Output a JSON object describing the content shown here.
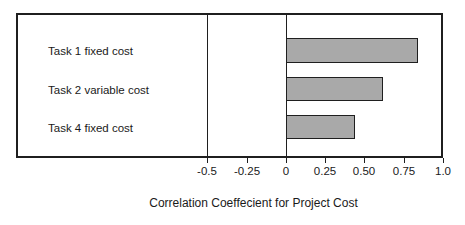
{
  "chart_data": {
    "type": "bar",
    "orientation": "horizontal",
    "title": "",
    "xlabel": "Correlation Coeffecient for Project Cost",
    "ylabel": "",
    "xlim": [
      -0.625,
      1.0
    ],
    "xticks": [
      -0.5,
      -0.25,
      0,
      0.25,
      0.5,
      0.75,
      1.0
    ],
    "xtick_labels": [
      "-0.5",
      "-0.25",
      "0",
      "0.25",
      "0.50",
      "0.75",
      "1.0"
    ],
    "grid": false,
    "legend": null,
    "reference_lines": [
      -0.5,
      0
    ],
    "bar_fill_color": "#a9a9a9",
    "bar_edge_color": "#1f1f1f",
    "categories": [
      "Task 1 fixed cost",
      "Task 2 variable cost",
      "Task 4 fixed cost"
    ],
    "values": [
      0.84,
      0.62,
      0.44
    ],
    "bars": [
      {
        "label": "Task 1 fixed cost",
        "value": 0.84
      },
      {
        "label": "Task 2 variable cost",
        "value": 0.62
      },
      {
        "label": "Task 4 fixed cost",
        "value": 0.44
      }
    ]
  },
  "axis": {
    "title": "Correlation Coeffecient for Project Cost"
  },
  "ticks": {
    "t0": "-0.5",
    "t1": "-0.25",
    "t2": "0",
    "t3": "0.25",
    "t4": "0.50",
    "t5": "0.75",
    "t6": "1.0"
  },
  "labels": {
    "row0": "Task 1 fixed cost",
    "row1": "Task 2 variable cost",
    "row2": "Task 4 fixed cost"
  }
}
